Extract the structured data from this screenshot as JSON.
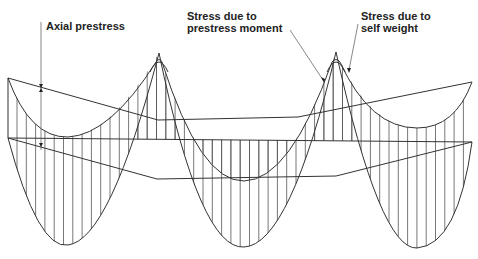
{
  "figure": {
    "type": "prestressed continuous beam stress diagram",
    "labels": {
      "axial_prestress": "Axial prestress",
      "prestress_moment_line1": "Stress due to",
      "prestress_moment_line2": "prestress moment",
      "self_weight_line1": "Stress due to",
      "self_weight_line2": "self weight"
    },
    "colors": {
      "line": "#333333",
      "hatch": "#555555",
      "text": "#222222",
      "background": "#ffffff"
    },
    "geometry": {
      "spans": 3,
      "supports_x": [
        8,
        159,
        336,
        472
      ],
      "peaks": [
        {
          "x": 159,
          "y": 53
        },
        {
          "x": 336,
          "y": 52
        }
      ],
      "parabola_bottoms": [
        {
          "x": 68,
          "y": 245
        },
        {
          "x": 244,
          "y": 247
        },
        {
          "x": 417,
          "y": 248
        }
      ],
      "axial_line": [
        [
          8,
          138
        ],
        [
          472,
          142
        ]
      ],
      "upper_moment_line": [
        [
          8,
          78
        ],
        [
          158,
          120
        ],
        [
          298,
          117
        ],
        [
          472,
          82
        ]
      ],
      "lower_moment_line": [
        [
          8,
          138
        ],
        [
          157,
          179
        ],
        [
          336,
          176
        ],
        [
          472,
          142
        ]
      ]
    }
  }
}
